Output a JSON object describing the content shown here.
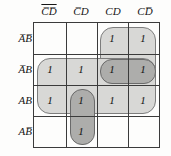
{
  "diagram": {
    "type": "karnaugh-map",
    "title": "",
    "variables": [
      "A",
      "B",
      "C",
      "D"
    ],
    "columns": [
      {
        "id": "col-0",
        "label": "CD",
        "bars": [
          true,
          true
        ],
        "text": "C̅D̅"
      },
      {
        "id": "col-1",
        "label": "CD",
        "bars": [
          true,
          false
        ],
        "text": "C̅D"
      },
      {
        "id": "col-2",
        "label": "CD",
        "bars": [
          false,
          false
        ],
        "text": "CD"
      },
      {
        "id": "col-3",
        "label": "CD",
        "bars": [
          false,
          true
        ],
        "text": "CD̅"
      }
    ],
    "rows": [
      {
        "id": "row-0",
        "label": "AB",
        "bars": [
          true,
          true
        ],
        "text": "A̅B̅"
      },
      {
        "id": "row-1",
        "label": "AB",
        "bars": [
          true,
          false
        ],
        "text": "A̅B"
      },
      {
        "id": "row-2",
        "label": "AB",
        "bars": [
          false,
          false
        ],
        "text": "AB"
      },
      {
        "id": "row-3",
        "label": "AB",
        "bars": [
          false,
          true
        ],
        "text": "AB̅"
      }
    ],
    "cells": [
      {
        "row": 0,
        "col": 0,
        "value": ""
      },
      {
        "row": 0,
        "col": 1,
        "value": ""
      },
      {
        "row": 0,
        "col": 2,
        "value": "1"
      },
      {
        "row": 0,
        "col": 3,
        "value": "1"
      },
      {
        "row": 1,
        "col": 0,
        "value": "1"
      },
      {
        "row": 1,
        "col": 1,
        "value": "1"
      },
      {
        "row": 1,
        "col": 2,
        "value": "1"
      },
      {
        "row": 1,
        "col": 3,
        "value": "1"
      },
      {
        "row": 2,
        "col": 0,
        "value": "1"
      },
      {
        "row": 2,
        "col": 1,
        "value": "1"
      },
      {
        "row": 2,
        "col": 2,
        "value": "1"
      },
      {
        "row": 2,
        "col": 3,
        "value": "1"
      },
      {
        "row": 3,
        "col": 0,
        "value": ""
      },
      {
        "row": 3,
        "col": 1,
        "value": "1"
      },
      {
        "row": 3,
        "col": 2,
        "value": ""
      },
      {
        "row": 3,
        "col": 3,
        "value": ""
      }
    ],
    "groups": [
      {
        "id": "group-cd-column-pair",
        "shade": "light",
        "rows": [
          0,
          1
        ],
        "cols": [
          2,
          3
        ]
      },
      {
        "id": "group-b-row-band",
        "shade": "light",
        "rows": [
          1,
          2
        ],
        "cols": [
          0,
          3
        ]
      },
      {
        "id": "group-abc-quad",
        "shade": "dark",
        "rows": [
          1,
          1
        ],
        "cols": [
          2,
          3
        ]
      },
      {
        "id": "group-acd-vertical",
        "shade": "dark",
        "rows": [
          2,
          3
        ],
        "cols": [
          1,
          1
        ]
      }
    ],
    "colors": {
      "grid_line": "#3b3b3b",
      "group_light_fill": "#d8d8d6",
      "group_dark_fill": "#adadab",
      "group_outline": "#7d7d7d",
      "background": "#fdfdfc",
      "text": "#161616"
    }
  }
}
